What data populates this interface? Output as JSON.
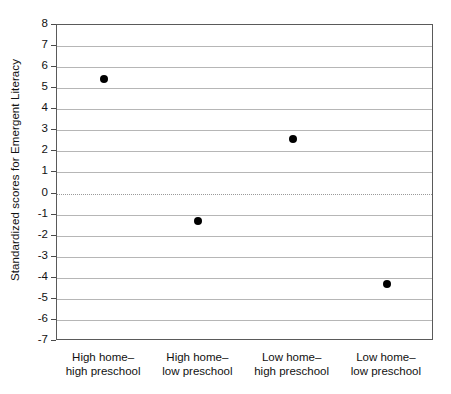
{
  "chart_data": {
    "type": "scatter",
    "title": "",
    "xlabel": "",
    "ylabel": "Standardized scores for Emergent Literacy",
    "ylim": [
      -7,
      8
    ],
    "ytick_labels": [
      "8",
      "7",
      "6",
      "5",
      "4",
      "3",
      "2",
      "1",
      "0",
      "-1",
      "-2",
      "-3",
      "-4",
      "-5",
      "-6",
      "-7"
    ],
    "yticks": [
      8,
      7,
      6,
      5,
      4,
      3,
      2,
      1,
      0,
      -1,
      -2,
      -3,
      -4,
      -5,
      -6,
      -7
    ],
    "grid": true,
    "zero_line": true,
    "legend": "none",
    "marker_color": "#000000",
    "categories": [
      "High home–high preschool",
      "High home–low preschool",
      "Low home–high preschool",
      "Low home–low preschool"
    ],
    "category_lines": [
      {
        "line1": "High home–",
        "line2": "high preschool"
      },
      {
        "line1": "High home–",
        "line2": "low preschool"
      },
      {
        "line1": "Low home–",
        "line2": "high preschool"
      },
      {
        "line1": "Low home–",
        "line2": "low preschool"
      }
    ],
    "values": [
      5.45,
      -1.3,
      2.6,
      -4.3
    ]
  },
  "colors": {
    "frame": "#5a5a5a",
    "gridline": "#b6b6b6",
    "zero_line": "#9a9a9a",
    "marker": "#000000",
    "background": "#ffffff",
    "text": "#111111"
  }
}
